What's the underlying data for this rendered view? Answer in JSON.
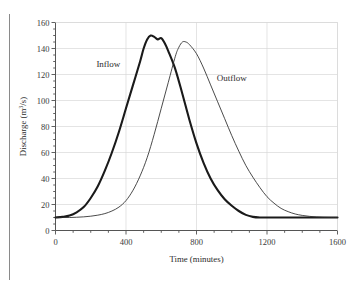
{
  "chart_data": {
    "type": "line",
    "title": "",
    "xlabel": "Time (minutes)",
    "ylabel": "Discharge (m³/s)",
    "ylabel_parts": {
      "base": "Discharge (m",
      "sup": "3",
      "tail": "/s)"
    },
    "xlim": [
      0,
      1600
    ],
    "ylim": [
      0,
      160
    ],
    "xticks": [
      0,
      400,
      800,
      1200,
      1600
    ],
    "xtick_labels": [
      "0",
      "400",
      "800",
      "1200",
      "1600"
    ],
    "x_minor_step": 100,
    "yticks": [
      0,
      20,
      40,
      60,
      80,
      100,
      120,
      140,
      160
    ],
    "ytick_labels": [
      "0",
      "20",
      "40",
      "60",
      "80",
      "100",
      "120",
      "140",
      "160"
    ],
    "y_minor_step": 5,
    "grid": {
      "horizontal": true,
      "vertical": true,
      "color": "#d9d9d9"
    },
    "legend_position": "inline-annotations",
    "annotations": [
      {
        "text": "Inflow",
        "x": 300,
        "y": 126
      },
      {
        "text": "Outflow",
        "x": 1000,
        "y": 115
      }
    ],
    "series": [
      {
        "name": "Inflow",
        "color": "#1a1a1a",
        "width": 2.1,
        "x": [
          0,
          40,
          80,
          120,
          160,
          200,
          240,
          280,
          320,
          360,
          400,
          440,
          480,
          500,
          520,
          540,
          560,
          580,
          600,
          620,
          640,
          680,
          720,
          760,
          800,
          840,
          880,
          920,
          960,
          1000,
          1040,
          1080,
          1120,
          1160,
          1200,
          1240,
          1280,
          1320,
          1400,
          1500,
          1600
        ],
        "y": [
          10,
          10.5,
          11.5,
          14,
          18,
          25,
          34,
          46,
          60,
          76,
          94,
          112,
          130,
          140,
          147,
          150,
          149,
          147,
          148,
          144,
          138,
          124,
          105,
          85,
          67,
          52,
          40,
          31,
          24,
          19,
          15,
          12,
          10.5,
          10,
          10,
          10,
          10,
          10,
          10,
          10,
          10
        ]
      },
      {
        "name": "Outflow",
        "color": "#2a2a2a",
        "width": 0.85,
        "x": [
          0,
          40,
          80,
          120,
          160,
          200,
          240,
          280,
          320,
          360,
          400,
          440,
          480,
          520,
          560,
          600,
          640,
          680,
          700,
          720,
          740,
          760,
          800,
          840,
          880,
          920,
          960,
          1000,
          1040,
          1080,
          1120,
          1160,
          1200,
          1240,
          1280,
          1320,
          1360,
          1400,
          1440,
          1480,
          1520,
          1560,
          1600
        ],
        "y": [
          10,
          10,
          10,
          10.2,
          10.5,
          11,
          11.8,
          13,
          15,
          18,
          23,
          31,
          42,
          56,
          74,
          94,
          114,
          134,
          141,
          145,
          145,
          143,
          136,
          125,
          112,
          99,
          86,
          73,
          61,
          50,
          41,
          33,
          26,
          21,
          17,
          14.5,
          12.7,
          11.6,
          10.9,
          10.4,
          10.1,
          10,
          10
        ]
      }
    ]
  },
  "axes": {
    "tick_color": "#3a3a3a",
    "spine_color": "#555555"
  }
}
